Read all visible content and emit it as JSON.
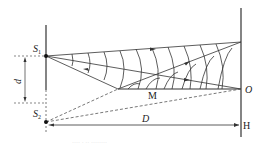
{
  "figure": {
    "type": "double-slit interference diagram",
    "labels": {
      "source1": "S",
      "source1_sub": "1",
      "source2": "S",
      "source2_sub": "2",
      "slit_spacing": "d",
      "screen_distance": "D",
      "midpoint": "M",
      "center_point": "O",
      "screen_foot": "H"
    },
    "caption": "···· · ·· ········"
  },
  "colors": {
    "line": "#333333",
    "dashed": "#555555",
    "background": "#ffffff"
  }
}
